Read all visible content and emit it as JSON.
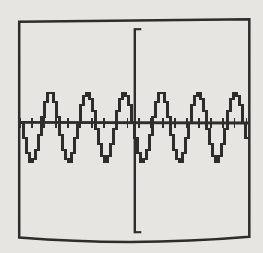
{
  "figure": {
    "colors": {
      "paper": "#f3f1ed",
      "ink": "#1b1b1b"
    }
  },
  "chart_data": {
    "type": "line",
    "waveform": "sine",
    "title": "",
    "xlabel": "",
    "ylabel": "",
    "axis_labels_visible": false,
    "grid": false,
    "legend": false,
    "cycles_visible": 6.2,
    "frame_px": {
      "left": 19.2,
      "top_left_y": 21.8,
      "right": 249.3,
      "top_right_y": 19.2,
      "bottom_right_y": 236.8,
      "bottom_left_y": 237.5,
      "bottom_sag_px": 9.5
    },
    "x_axis": {
      "y_start_px": 122.3,
      "y_end_px": 123.0,
      "x_start_px": 20.4,
      "x_end_px": 248.3,
      "first_tick_x_px": 20.3,
      "tick_spacing_px": 11.9,
      "tick_count": 20,
      "tick_top_px": 118.2,
      "tick_bottom_px": 127.7
    },
    "y_axis": {
      "x_px": 134.8,
      "top_px": 28.2,
      "bottom_px": 233.2,
      "end_cap_len_px": 6.5
    },
    "wave": {
      "x_start_px": 20.5,
      "x_end_px": 248.5,
      "midline_y_px": 126.5,
      "amplitude_px": 34.5,
      "period_px": 37,
      "first_peak_x_px": 50.5,
      "pixel_step_px": 3,
      "y_quantum_px": 3,
      "peak_y_px": 92,
      "trough_y_px": 161
    },
    "grain": {
      "opacity": 0.13
    }
  }
}
